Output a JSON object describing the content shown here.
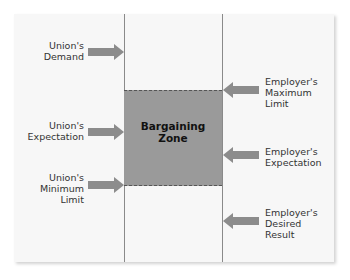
{
  "diagram": {
    "zone": {
      "label": "Bargaining\nZone"
    },
    "union": [
      {
        "label": "Union's\nDemand"
      },
      {
        "label": "Union's\nExpectation"
      },
      {
        "label": "Union's\nMinimum\nLimit"
      }
    ],
    "employer": [
      {
        "label": "Employer's\nMaximum\nLimit"
      },
      {
        "label": "Employer's\nExpectation"
      },
      {
        "label": "Employer's\nDesired\nResult"
      }
    ],
    "colors": {
      "panel": "#f7f7f7",
      "zone": "#9a9a9a",
      "arrow": "#8c8c8c",
      "line": "#8a8a8a"
    }
  }
}
